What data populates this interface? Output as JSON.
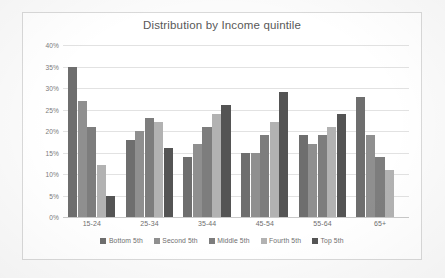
{
  "chart_data": {
    "type": "bar",
    "title": "Distribution by Income quintile",
    "xlabel": "",
    "ylabel": "",
    "ylim": [
      0,
      40
    ],
    "ytick_labels": [
      "0%",
      "5%",
      "10%",
      "15%",
      "20%",
      "25%",
      "30%",
      "35%",
      "40%"
    ],
    "ytick_values": [
      0,
      5,
      10,
      15,
      20,
      25,
      30,
      35,
      40
    ],
    "grid": true,
    "legend_position": "bottom",
    "categories": [
      "15-24",
      "25-34",
      "35-44",
      "45-54",
      "55-64",
      "65+"
    ],
    "series": [
      {
        "name": "Bottom 5th",
        "color": "#6e6e6e",
        "values": [
          35,
          18,
          14,
          15,
          19,
          28
        ]
      },
      {
        "name": "Second 5th",
        "color": "#8f8f8f",
        "values": [
          27,
          20,
          17,
          15,
          17,
          19
        ]
      },
      {
        "name": "Middle 5th",
        "color": "#7d7d7d",
        "values": [
          21,
          23,
          21,
          19,
          19,
          14
        ]
      },
      {
        "name": "Fourth 5th",
        "color": "#b2b2b2",
        "values": [
          12,
          22,
          24,
          22,
          21,
          11
        ]
      },
      {
        "name": "Top 5th",
        "color": "#545454",
        "values": [
          5,
          16,
          26,
          29,
          24,
          null
        ]
      }
    ]
  },
  "style": {
    "page_background": "#fbfbfb",
    "chart_background": "#ffffff",
    "frame_border": "#d9d9d9",
    "gridline_color": "#e2e2e2",
    "axis_color": "#c9c9c9",
    "title_color": "#585858",
    "tick_color": "#7a7a7a",
    "label_color": "#6f6f6f"
  }
}
